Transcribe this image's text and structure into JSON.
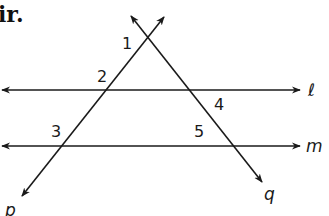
{
  "header": {
    "fragment_text": "ir."
  },
  "diagram": {
    "colors": {
      "stroke": "#1a1a1a",
      "background": "#ffffff"
    },
    "lines": [
      {
        "id": "l",
        "label": "ℓ",
        "type": "horizontal",
        "x1": 2,
        "y1": 90,
        "x2": 300,
        "y2": 90,
        "label_x": 308,
        "label_y": 96
      },
      {
        "id": "m",
        "label": "m",
        "type": "horizontal",
        "x1": 2,
        "y1": 146,
        "x2": 300,
        "y2": 146,
        "label_x": 306,
        "label_y": 152
      },
      {
        "id": "p",
        "label": "p",
        "type": "transversal",
        "x1": 164,
        "y1": 17,
        "x2": 22,
        "y2": 196,
        "label_x": 5,
        "label_y": 216
      },
      {
        "id": "q",
        "label": "q",
        "type": "transversal",
        "x1": 131,
        "y1": 16,
        "x2": 262,
        "y2": 182,
        "label_x": 264,
        "label_y": 200
      }
    ],
    "angles": [
      {
        "number": "1",
        "x": 122,
        "y": 49
      },
      {
        "number": "2",
        "x": 97,
        "y": 82
      },
      {
        "number": "3",
        "x": 51,
        "y": 137
      },
      {
        "number": "4",
        "x": 214,
        "y": 110
      },
      {
        "number": "5",
        "x": 194,
        "y": 137
      }
    ]
  }
}
